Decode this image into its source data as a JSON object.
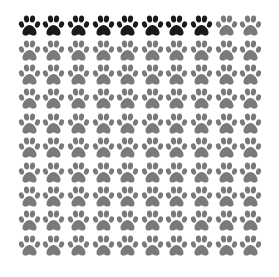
{
  "chart_data": {
    "type": "pictogram",
    "title": "",
    "rows": 10,
    "cols": 10,
    "total": 100,
    "icon": "paw-print-icon",
    "series": [
      {
        "name": "highlighted",
        "value": 8,
        "color": "#1a1a1a"
      },
      {
        "name": "remaining",
        "value": 92,
        "color": "#7a7a7a"
      }
    ],
    "fill_order": "row-major, left-to-right from top-left"
  }
}
